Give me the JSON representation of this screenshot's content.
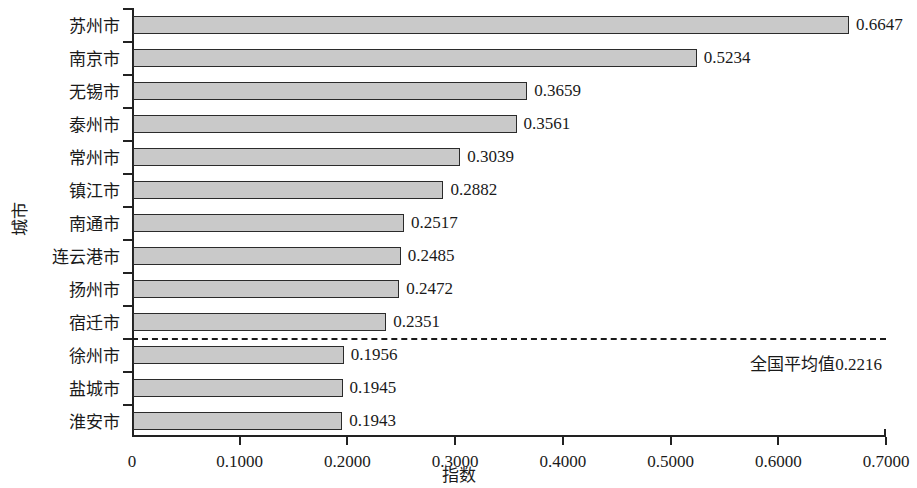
{
  "chart_data": {
    "type": "bar",
    "orientation": "horizontal",
    "title": "",
    "xlabel": "指数",
    "ylabel": "城市",
    "xlim": [
      0,
      0.7
    ],
    "xticks": [
      0,
      0.1,
      0.2,
      0.3,
      0.4,
      0.5,
      0.6,
      0.7
    ],
    "xtick_labels": [
      "0",
      "0.1000",
      "0.2000",
      "0.3000",
      "0.4000",
      "0.5000",
      "0.6000",
      "0.7000"
    ],
    "grid": false,
    "legend": false,
    "categories": [
      "苏州市",
      "南京市",
      "无锡市",
      "泰州市",
      "常州市",
      "镇江市",
      "南通市",
      "连云港市",
      "扬州市",
      "宿迁市",
      "徐州市",
      "盐城市",
      "淮安市"
    ],
    "values": [
      0.6647,
      0.5234,
      0.3659,
      0.3561,
      0.3039,
      0.2882,
      0.2517,
      0.2485,
      0.2472,
      0.2351,
      0.1956,
      0.1945,
      0.1943
    ],
    "value_labels": [
      "0.6647",
      "0.5234",
      "0.3659",
      "0.3561",
      "0.3039",
      "0.2882",
      "0.2517",
      "0.2485",
      "0.2472",
      "0.2351",
      "0.1956",
      "0.1945",
      "0.1943"
    ],
    "bar_fill_color": "#c9c9c9",
    "bar_edge_color": "#2b2b2b",
    "annotations": [
      {
        "name": "national-average-line",
        "label": "全国平均值0.2216",
        "value": 0.2216,
        "style": "dashed-horizontal-separator",
        "after_category_index": 9
      }
    ]
  }
}
